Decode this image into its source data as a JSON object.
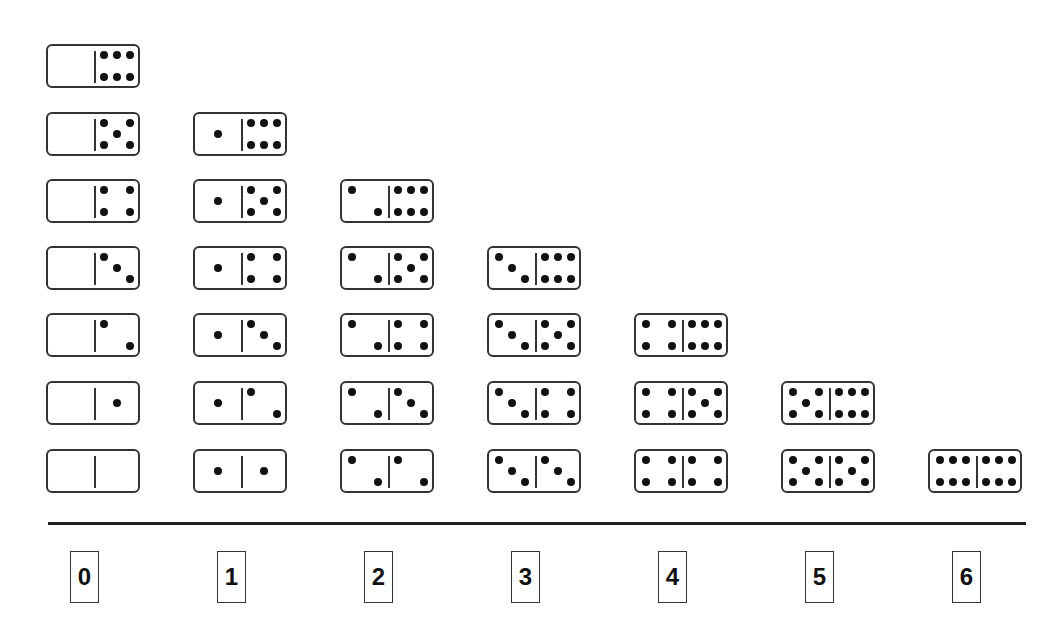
{
  "diagram": {
    "title": "",
    "columns": [
      {
        "label": "0",
        "dominoes": [
          [
            0,
            6
          ],
          [
            0,
            5
          ],
          [
            0,
            4
          ],
          [
            0,
            3
          ],
          [
            0,
            2
          ],
          [
            0,
            1
          ],
          [
            0,
            0
          ]
        ]
      },
      {
        "label": "1",
        "dominoes": [
          [
            1,
            6
          ],
          [
            1,
            5
          ],
          [
            1,
            4
          ],
          [
            1,
            3
          ],
          [
            1,
            2
          ],
          [
            1,
            1
          ]
        ]
      },
      {
        "label": "2",
        "dominoes": [
          [
            2,
            6
          ],
          [
            2,
            5
          ],
          [
            2,
            4
          ],
          [
            2,
            3
          ],
          [
            2,
            2
          ]
        ]
      },
      {
        "label": "3",
        "dominoes": [
          [
            3,
            6
          ],
          [
            3,
            5
          ],
          [
            3,
            4
          ],
          [
            3,
            3
          ]
        ]
      },
      {
        "label": "4",
        "dominoes": [
          [
            4,
            6
          ],
          [
            4,
            5
          ],
          [
            4,
            4
          ]
        ]
      },
      {
        "label": "5",
        "dominoes": [
          [
            5,
            6
          ],
          [
            5,
            5
          ]
        ]
      },
      {
        "label": "6",
        "dominoes": [
          [
            6,
            6
          ]
        ]
      }
    ],
    "colors": {
      "ink": "#111111",
      "border": "#333333",
      "background": "#ffffff"
    }
  }
}
